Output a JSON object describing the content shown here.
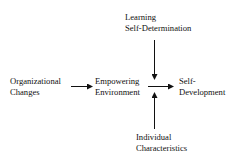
{
  "diagram": {
    "nodes": {
      "learning": {
        "line1": "Learning",
        "line2": "Self-Determination"
      },
      "org_changes": {
        "line1": "Organizational",
        "line2": "Changes"
      },
      "empowering": {
        "line1": "Empowering",
        "line2": "Environment"
      },
      "self_dev": {
        "line1": "Self-",
        "line2": "Development"
      },
      "individual": {
        "line1": "Individual",
        "line2": "Characteristics"
      }
    },
    "edges": [
      {
        "from": "Organizational Changes",
        "to": "Empowering Environment"
      },
      {
        "from": "Empowering Environment",
        "to": "Self-Development"
      },
      {
        "from": "Learning Self-Determination",
        "to": "Empowering Environment -> Self-Development"
      },
      {
        "from": "Individual Characteristics",
        "to": "Empowering Environment -> Self-Development"
      }
    ],
    "colors": {
      "line": "#111111",
      "background": "#ffffff"
    }
  }
}
